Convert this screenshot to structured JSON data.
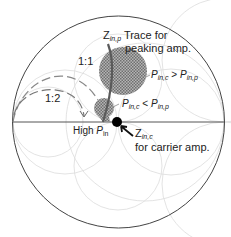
{
  "diagram": {
    "type": "smith-chart",
    "colors": {
      "boundary": "#333333",
      "grid": "#d9d9d9",
      "shaded_region": "#8a8a8a",
      "trace": "#666666",
      "dot": "#000000",
      "dashed_arc": "#777777"
    },
    "labels": {
      "trace_title_sym": "Z",
      "trace_title_sub": "in,p",
      "trace_title_text": " Trace for",
      "trace_title_line2": "peaking amp.",
      "ratio_1_1": "1:1",
      "ratio_1_2": "1:2",
      "large_region_p1": "P",
      "large_region_p1_sub": "in,c",
      "large_region_op": " > ",
      "large_region_p2": "P",
      "large_region_p2_sub": "in,p",
      "small_region_p1": "P",
      "small_region_p1_sub": "in,c",
      "small_region_op": " < ",
      "small_region_p2": "P",
      "small_region_p2_sub": "in,p",
      "high_pin_text": "High ",
      "high_pin_sym": "P",
      "high_pin_sub": "in",
      "carrier_sym": "Z",
      "carrier_sub": "in,c",
      "carrier_text": "for carrier amp."
    }
  }
}
